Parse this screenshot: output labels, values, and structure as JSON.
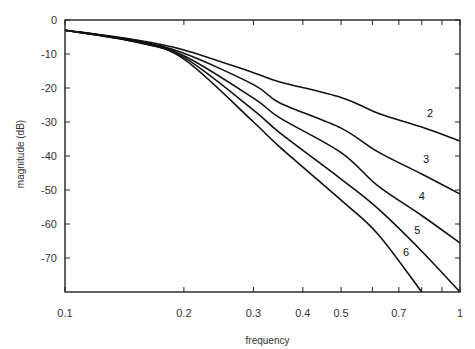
{
  "chart_data": {
    "type": "line",
    "title": "",
    "xlabel": "frequency",
    "ylabel": "magnitude  (dB)",
    "xscale": "log",
    "xlim": [
      0.1,
      1
    ],
    "ylim": [
      -80,
      0
    ],
    "grid": false,
    "legend": "none (inline curve labels)",
    "x_ticks": [
      0.1,
      0.2,
      0.3,
      0.4,
      0.5,
      0.6,
      0.7,
      0.8,
      0.9,
      1
    ],
    "x_tick_labels": [
      {
        "value": 0.1,
        "label": "0.1"
      },
      {
        "value": 0.2,
        "label": "0.2"
      },
      {
        "value": 0.3,
        "label": "0.3"
      },
      {
        "value": 0.4,
        "label": "0.4"
      },
      {
        "value": 0.5,
        "label": "0.5"
      },
      {
        "value": 0.7,
        "label": "0.7"
      },
      {
        "value": 1,
        "label": "1"
      }
    ],
    "y_ticks": [
      {
        "value": 0,
        "label": "0"
      },
      {
        "value": -10,
        "label": "-10"
      },
      {
        "value": -20,
        "label": "-20"
      },
      {
        "value": -30,
        "label": "-30"
      },
      {
        "value": -40,
        "label": "-40"
      },
      {
        "value": -50,
        "label": "-50"
      },
      {
        "value": -60,
        "label": "-60"
      },
      {
        "value": -70,
        "label": "-70"
      }
    ],
    "x": [
      0.1,
      0.15,
      0.2,
      0.3,
      0.35,
      0.5,
      0.62,
      0.8,
      1.0
    ],
    "series": [
      {
        "name": "2",
        "label_at": {
          "f": 0.84,
          "db": -28.5
        },
        "values": [
          -3,
          -5.8,
          -8.8,
          -15.5,
          -18.2,
          -22.8,
          -27.4,
          -31.5,
          -35.6
        ]
      },
      {
        "name": "3",
        "label_at": {
          "f": 0.82,
          "db": -42.0
        },
        "values": [
          -3,
          -6.0,
          -9.8,
          -19.0,
          -24.4,
          -31.8,
          -38.8,
          -45.3,
          -51.2
        ]
      },
      {
        "name": "4",
        "label_at": {
          "f": 0.8,
          "db": -53.0
        },
        "values": [
          -3,
          -6.2,
          -10.5,
          -23.0,
          -28.8,
          -39.0,
          -48.8,
          -57.5,
          -65.6
        ]
      },
      {
        "name": "5",
        "label_at": {
          "f": 0.78,
          "db": -62.8
        },
        "values": [
          -3,
          -6.3,
          -11.0,
          -26.5,
          -33.2,
          -46.8,
          -55.5,
          -68.0,
          -80.0
        ]
      },
      {
        "name": "6",
        "label_at": {
          "f": 0.73,
          "db": -69.5
        },
        "values": [
          -3,
          -6.4,
          -11.5,
          -30.0,
          -37.4,
          -53.0,
          -63.0,
          -80.0,
          null
        ]
      }
    ]
  }
}
